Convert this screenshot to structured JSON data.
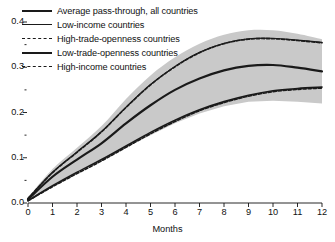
{
  "chart_data": {
    "type": "line",
    "title": "",
    "xlabel": "Months",
    "ylabel": "",
    "xlim": [
      0,
      12
    ],
    "ylim": [
      0,
      0.4
    ],
    "grid": false,
    "legend_position": "top-left",
    "x_ticks": [
      "0",
      "1",
      "2",
      "3",
      "4",
      "5",
      "6",
      "7",
      "8",
      "9",
      "10",
      "11",
      "12"
    ],
    "y_ticks": [
      "0.0",
      "0.1",
      "0.2",
      "0.3",
      "0.4"
    ],
    "y_minor_ticks": [
      0.05,
      0.15,
      0.25,
      0.35
    ],
    "x": [
      0,
      1,
      2,
      3,
      4,
      5,
      6,
      7,
      8,
      9,
      10,
      11,
      12
    ],
    "band": {
      "name": "Confidence band, average pass-through",
      "color": "#c9c9c9",
      "upper": [
        0.012,
        0.075,
        0.122,
        0.17,
        0.23,
        0.282,
        0.322,
        0.352,
        0.372,
        0.382,
        0.382,
        0.374,
        0.362
      ],
      "lower": [
        0.004,
        0.04,
        0.07,
        0.094,
        0.122,
        0.15,
        0.176,
        0.198,
        0.214,
        0.224,
        0.226,
        0.224,
        0.22
      ]
    },
    "series": [
      {
        "name": "Average pass-through, all countries",
        "style": "solid",
        "width": 2.2,
        "color": "#1a1a1a",
        "values": [
          0.008,
          0.058,
          0.096,
          0.132,
          0.176,
          0.216,
          0.25,
          0.275,
          0.293,
          0.303,
          0.305,
          0.299,
          0.291
        ]
      },
      {
        "name": "Low-income countries",
        "style": "solid",
        "width": 1.1,
        "color": "#1a1a1a",
        "values": [
          0.01,
          0.068,
          0.113,
          0.158,
          0.212,
          0.262,
          0.302,
          0.333,
          0.353,
          0.363,
          0.364,
          0.36,
          0.355
        ]
      },
      {
        "name": "High-trade-openness countries",
        "style": "dashed",
        "width": 1.6,
        "color": "#1a1a1a",
        "values": [
          0.01,
          0.067,
          0.112,
          0.157,
          0.211,
          0.261,
          0.301,
          0.332,
          0.352,
          0.362,
          0.363,
          0.359,
          0.354
        ]
      },
      {
        "name": "Low-trade-openness countries",
        "style": "solid",
        "width": 1.6,
        "color": "#1a1a1a",
        "values": [
          0.005,
          0.038,
          0.068,
          0.096,
          0.126,
          0.156,
          0.183,
          0.206,
          0.224,
          0.238,
          0.248,
          0.253,
          0.256
        ]
      },
      {
        "name": "High-income countries",
        "style": "dashed",
        "width": 1.6,
        "color": "#1a1a1a",
        "values": [
          0.005,
          0.036,
          0.065,
          0.093,
          0.123,
          0.153,
          0.18,
          0.204,
          0.222,
          0.236,
          0.246,
          0.251,
          0.254
        ]
      }
    ]
  },
  "legend": {
    "items": [
      {
        "label": "Average pass-through, all countries",
        "key": "thick-solid-line"
      },
      {
        "label": "Low-income countries",
        "key": "thin-solid-line"
      },
      {
        "label": "High-trade-openness countries",
        "key": "dashed-line"
      },
      {
        "label": "Low-trade-openness countries",
        "key": "solid-line"
      },
      {
        "label": "High-income countries",
        "key": "dashed-line"
      }
    ]
  },
  "axes": {
    "x_title": "Months"
  }
}
